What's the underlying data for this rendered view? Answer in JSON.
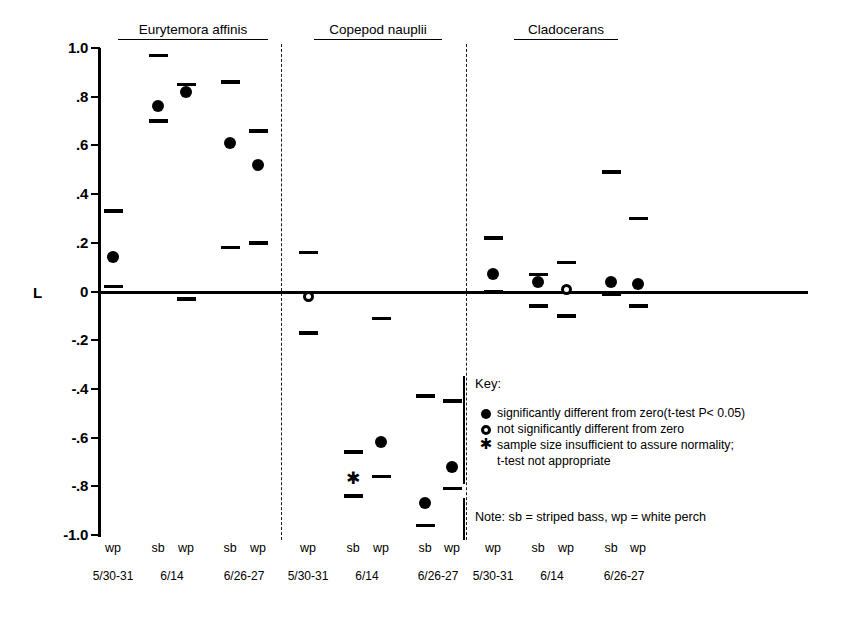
{
  "axis": {
    "y_name": "L",
    "y_ticks": [
      "1.0",
      ".8",
      ".6",
      ".4",
      ".2",
      "0",
      "-.2",
      "-.4",
      "-.6",
      "-.8",
      "-1.0"
    ],
    "y_tick_values": [
      1.0,
      0.8,
      0.6,
      0.4,
      0.2,
      0,
      -0.2,
      -0.4,
      -0.6,
      -0.8,
      -1.0
    ],
    "ylim": [
      -1.0,
      1.0
    ]
  },
  "groups": [
    {
      "name": "Eurytemora affinis"
    },
    {
      "name": "Copepod nauplii"
    },
    {
      "name": "Cladocerans"
    }
  ],
  "key": {
    "title": "Key:",
    "entries": [
      {
        "glyph": "filled-circle",
        "text": "significantly different from zero(t-test P< 0.05)"
      },
      {
        "glyph": "open-circle",
        "text": "not significantly different from zero"
      },
      {
        "glyph": "asterisk",
        "text": "sample size insufficient to assure normality;"
      },
      {
        "glyph": "none",
        "text": "t-test not appropriate"
      }
    ],
    "note": "Note: sb = striped bass, wp = white perch"
  },
  "chart_data": {
    "type": "scatter",
    "title": "",
    "xlabel": "",
    "ylabel": "L",
    "ylim": [
      -1.0,
      1.0
    ],
    "grid": false,
    "legend_position": "inside-right",
    "y_ticks": [
      1.0,
      0.8,
      0.6,
      0.4,
      0.2,
      0,
      -0.2,
      -0.4,
      -0.6,
      -0.8,
      -1.0
    ],
    "group_labels": [
      "Eurytemora affinis",
      "Copepod nauplii",
      "Cladocerans"
    ],
    "date_labels": [
      "5/30-31",
      "6/14",
      "6/26-27"
    ],
    "species_labels": [
      "sb",
      "wp"
    ],
    "marker_meaning": {
      "filled-circle": "significantly different from zero (t-test P< 0.05)",
      "open-circle": "not significantly different from zero",
      "asterisk": "sample size insufficient to assure normality; t-test not appropriate"
    },
    "points": [
      {
        "group": "Eurytemora affinis",
        "date": "5/30-31",
        "fish": "wp",
        "x": 113,
        "value": 0.14,
        "upper": 0.33,
        "lower": 0.02,
        "marker": "filled-circle"
      },
      {
        "group": "Eurytemora affinis",
        "date": "6/14",
        "fish": "sb",
        "x": 158,
        "value": 0.76,
        "upper": 0.97,
        "lower": 0.7,
        "marker": "filled-circle"
      },
      {
        "group": "Eurytemora affinis",
        "date": "6/14",
        "fish": "wp",
        "x": 186,
        "value": 0.82,
        "upper": 0.85,
        "lower": -0.03,
        "marker": "filled-circle"
      },
      {
        "group": "Eurytemora affinis",
        "date": "6/26-27",
        "fish": "sb",
        "x": 230,
        "value": 0.61,
        "upper": 0.86,
        "lower": 0.18,
        "marker": "filled-circle"
      },
      {
        "group": "Eurytemora affinis",
        "date": "6/26-27",
        "fish": "wp",
        "x": 258,
        "value": 0.52,
        "upper": 0.66,
        "lower": 0.2,
        "marker": "filled-circle"
      },
      {
        "group": "Copepod nauplii",
        "date": "5/30-31",
        "fish": "wp",
        "x": 308,
        "value": -0.02,
        "upper": 0.16,
        "lower": -0.17,
        "marker": "open-circle"
      },
      {
        "group": "Copepod nauplii",
        "date": "6/14",
        "fish": "sb",
        "x": 353,
        "value": -0.77,
        "upper": -0.66,
        "lower": -0.84,
        "marker": "asterisk"
      },
      {
        "group": "Copepod nauplii",
        "date": "6/14",
        "fish": "wp",
        "x": 381,
        "value": -0.62,
        "upper": -0.11,
        "lower": -0.76,
        "marker": "filled-circle"
      },
      {
        "group": "Copepod nauplii",
        "date": "6/26-27",
        "fish": "sb",
        "x": 425,
        "value": -0.87,
        "upper": -0.43,
        "lower": -0.96,
        "marker": "filled-circle"
      },
      {
        "group": "Copepod nauplii",
        "date": "6/26-27",
        "fish": "wp",
        "x": 452,
        "value": -0.72,
        "upper": -0.45,
        "lower": -0.81,
        "marker": "filled-circle"
      },
      {
        "group": "Cladocerans",
        "date": "5/30-31",
        "fish": "wp",
        "x": 493,
        "value": 0.07,
        "upper": 0.22,
        "lower": 0.0,
        "marker": "filled-circle"
      },
      {
        "group": "Cladocerans",
        "date": "6/14",
        "fish": "sb",
        "x": 538,
        "value": 0.04,
        "upper": 0.07,
        "lower": -0.06,
        "marker": "filled-circle"
      },
      {
        "group": "Cladocerans",
        "date": "6/14",
        "fish": "wp",
        "x": 566,
        "value": 0.01,
        "upper": 0.12,
        "lower": -0.1,
        "marker": "open-circle"
      },
      {
        "group": "Cladocerans",
        "date": "6/26-27",
        "fish": "sb",
        "x": 611,
        "value": 0.04,
        "upper": 0.49,
        "lower": -0.01,
        "marker": "filled-circle"
      },
      {
        "group": "Cladocerans",
        "date": "6/26-27",
        "fish": "wp",
        "x": 638,
        "value": 0.03,
        "upper": 0.3,
        "lower": -0.06,
        "marker": "filled-circle"
      }
    ],
    "x_axis_entries": [
      {
        "x": 113,
        "fish": "wp"
      },
      {
        "x": 158,
        "fish": "sb"
      },
      {
        "x": 186,
        "fish": "wp"
      },
      {
        "x": 230,
        "fish": "sb"
      },
      {
        "x": 258,
        "fish": "wp"
      },
      {
        "x": 308,
        "fish": "wp"
      },
      {
        "x": 353,
        "fish": "sb"
      },
      {
        "x": 381,
        "fish": "wp"
      },
      {
        "x": 425,
        "fish": "sb"
      },
      {
        "x": 452,
        "fish": "wp"
      },
      {
        "x": 493,
        "fish": "wp"
      },
      {
        "x": 538,
        "fish": "sb"
      },
      {
        "x": 566,
        "fish": "wp"
      },
      {
        "x": 611,
        "fish": "sb"
      },
      {
        "x": 638,
        "fish": "wp"
      }
    ],
    "date_entries": [
      {
        "x": 113,
        "label": "5/30-31"
      },
      {
        "x": 172,
        "label": "6/14"
      },
      {
        "x": 244,
        "label": "6/26-27"
      },
      {
        "x": 308,
        "label": "5/30-31"
      },
      {
        "x": 367,
        "label": "6/14"
      },
      {
        "x": 438,
        "label": "6/26-27"
      },
      {
        "x": 493,
        "label": "5/30-31"
      },
      {
        "x": 552,
        "label": "6/14"
      },
      {
        "x": 624,
        "label": "6/26-27"
      }
    ],
    "group_header_entries": [
      {
        "label": "Eurytemora affinis",
        "x": 193,
        "width": 150
      },
      {
        "label": "Copepod nauplii",
        "x": 378,
        "width": 128
      },
      {
        "label": "Cladocerans",
        "x": 566,
        "width": 104
      }
    ]
  }
}
